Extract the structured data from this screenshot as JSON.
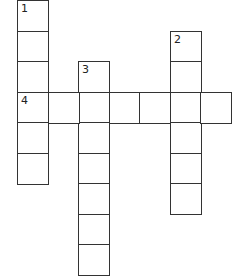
{
  "puzzle": {
    "type": "crossword",
    "cell_size": 30.5,
    "origin": {
      "x": 17,
      "y": 0
    },
    "clue_numbers": [
      "1",
      "2",
      "3",
      "4"
    ],
    "words": [
      {
        "number": "1",
        "direction": "down",
        "row": 0,
        "col": 0,
        "length": 6
      },
      {
        "number": "2",
        "direction": "down",
        "row": 1,
        "col": 5,
        "length": 6
      },
      {
        "number": "3",
        "direction": "down",
        "row": 2,
        "col": 2,
        "length": 7
      },
      {
        "number": "4",
        "direction": "across",
        "row": 3,
        "col": 0,
        "length": 7
      }
    ]
  }
}
